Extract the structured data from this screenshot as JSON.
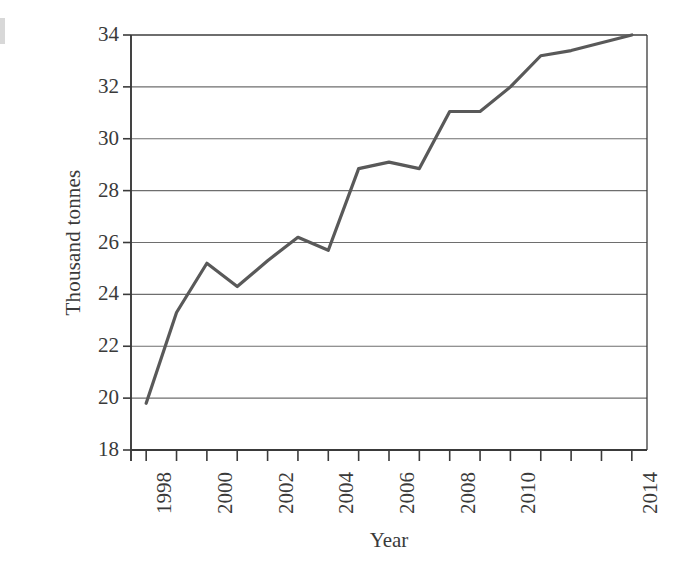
{
  "chart_data": {
    "type": "line",
    "title": "",
    "xlabel": "Year",
    "ylabel": "Thousand tonnes",
    "x": [
      1998,
      1999,
      2000,
      2001,
      2002,
      2003,
      2004,
      2005,
      2006,
      2007,
      2008,
      2009,
      2010,
      2011,
      2012,
      2013,
      2014
    ],
    "values": [
      19.8,
      23.3,
      25.2,
      24.3,
      25.3,
      26.2,
      25.7,
      28.85,
      29.1,
      28.85,
      31.05,
      31.05,
      32.0,
      33.2,
      33.4,
      33.7,
      34.0
    ],
    "series": [
      {
        "name": "Thousand tonnes",
        "values": [
          19.8,
          23.3,
          25.2,
          24.3,
          25.3,
          26.2,
          25.7,
          28.85,
          29.1,
          28.85,
          31.05,
          31.05,
          32.0,
          33.2,
          33.4,
          33.7,
          34.0
        ]
      }
    ],
    "xlim": [
      1997.5,
      2014.5
    ],
    "ylim": [
      18,
      34
    ],
    "ytick_values": [
      18,
      20,
      22,
      24,
      26,
      28,
      30,
      32,
      34
    ],
    "ytick_labels": [
      "18",
      "20",
      "22",
      "24",
      "26",
      "28",
      "30",
      "32",
      "34"
    ],
    "xtick_values": [
      1998,
      1999,
      2000,
      2001,
      2002,
      2003,
      2004,
      2005,
      2006,
      2007,
      2008,
      2009,
      2010,
      2011,
      2012,
      2013,
      2014
    ],
    "xtick_labels": [
      "1998",
      "",
      "2000",
      "",
      "2002",
      "",
      "2004",
      "",
      "2006",
      "",
      "2008",
      "",
      "2010",
      "",
      "",
      "",
      "2014"
    ],
    "grid": "horizontal",
    "legend": "none",
    "line_color": "#595959",
    "axis_color": "#3a3a3a",
    "grid_color": "#6e6e6e",
    "background": "#ffffff"
  },
  "axes": {
    "y_title": "Thousand tonnes",
    "x_title": "Year"
  }
}
